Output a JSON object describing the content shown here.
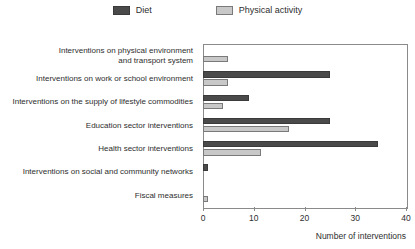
{
  "legend": {
    "position": "top-center",
    "items": [
      {
        "label": "Diet",
        "color": "#4a4a4a",
        "icon": "square-swatch-dark"
      },
      {
        "label": "Physical activity",
        "color": "#c8c8c8",
        "icon": "square-swatch-light"
      }
    ]
  },
  "axis": {
    "x_title": "Number of interventions",
    "ticks": [
      "0",
      "10",
      "20",
      "30",
      "40"
    ]
  },
  "chart_data": {
    "type": "bar",
    "orientation": "horizontal",
    "title": "",
    "subtitle": "",
    "xlabel": "Number of interventions",
    "ylabel": "",
    "xlim": [
      0,
      40
    ],
    "xticks": [
      0,
      10,
      20,
      30,
      40
    ],
    "grid": false,
    "legend_position": "top-center",
    "categories": [
      "Interventions on physical environment\nand transport system",
      "Interventions on work or school environment",
      "Interventions on the supply of lifestyle commodities",
      "Education sector interventions",
      "Health sector interventions",
      "Interventions on social and community networks",
      "Fiscal measures"
    ],
    "series": [
      {
        "name": "Diet",
        "color": "#4a4a4a",
        "values": [
          0,
          25,
          9,
          25,
          34.5,
          1,
          0
        ]
      },
      {
        "name": "Physical activity",
        "color": "#c8c8c8",
        "values": [
          5,
          5,
          4,
          17,
          11.5,
          0,
          1
        ]
      }
    ]
  }
}
